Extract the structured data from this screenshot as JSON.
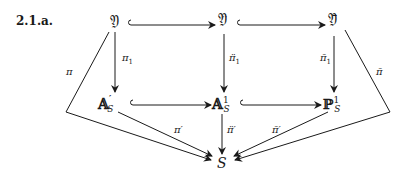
{
  "diagram": {
    "label": "2.1.a.",
    "nodes": {
      "Y": "𝔜",
      "Y_ddot": "𝔜̈",
      "Y_bar": "𝔜̄",
      "A_prime_S": {
        "base": "𝔸",
        "sup": "′",
        "sub": "S"
      },
      "A1_S": {
        "base": "𝔸",
        "sup": "1",
        "sub": "S"
      },
      "P1_S": {
        "base": "ℙ",
        "sup": "1",
        "sub": "S"
      },
      "S": "S"
    },
    "maps": {
      "pi1": {
        "base": "π",
        "sub": "1"
      },
      "pi1_ddot": {
        "base": "π̈",
        "sub": "1"
      },
      "pi1_bar": {
        "base": "π̄",
        "sub": "1"
      },
      "pi": "π",
      "pi_bar": "π̄",
      "pi_prime": "π′",
      "pi_ddot_prime": "π̈′",
      "pi_bar_prime": "π̄′"
    },
    "edges": [
      {
        "from": "Y",
        "to": "Y_ddot",
        "type": "inclusion"
      },
      {
        "from": "Y_ddot",
        "to": "Y_bar",
        "type": "inclusion"
      },
      {
        "from": "A_prime_S",
        "to": "A1_S",
        "type": "inclusion"
      },
      {
        "from": "A1_S",
        "to": "P1_S",
        "type": "inclusion"
      },
      {
        "from": "Y",
        "to": "A_prime_S",
        "label": "pi1"
      },
      {
        "from": "Y_ddot",
        "to": "A1_S",
        "label": "pi1_ddot"
      },
      {
        "from": "Y_bar",
        "to": "P1_S",
        "label": "pi1_bar"
      },
      {
        "from": "Y",
        "to": "S",
        "label": "pi",
        "route": "left"
      },
      {
        "from": "Y_bar",
        "to": "S",
        "label": "pi_bar",
        "route": "right"
      },
      {
        "from": "A_prime_S",
        "to": "S",
        "label": "pi_prime"
      },
      {
        "from": "A1_S",
        "to": "S",
        "label": "pi_ddot_prime"
      },
      {
        "from": "P1_S",
        "to": "S",
        "label": "pi_bar_prime"
      }
    ]
  }
}
